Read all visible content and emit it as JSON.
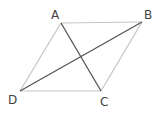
{
  "diagram": {
    "type": "parallelogram with diagonals",
    "vertices": [
      {
        "name": "A",
        "x": 61,
        "y": 23,
        "label_x": 51,
        "label_y": 19
      },
      {
        "name": "B",
        "x": 142,
        "y": 22,
        "label_x": 144,
        "label_y": 19
      },
      {
        "name": "C",
        "x": 101,
        "y": 91,
        "label_x": 101,
        "label_y": 106
      },
      {
        "name": "D",
        "x": 20,
        "y": 91,
        "label_x": 9,
        "label_y": 103
      }
    ],
    "edges": [
      [
        "A",
        "B"
      ],
      [
        "B",
        "C"
      ],
      [
        "C",
        "D"
      ],
      [
        "D",
        "A"
      ]
    ],
    "diagonals": [
      [
        "A",
        "C"
      ],
      [
        "D",
        "B"
      ]
    ],
    "colors": {
      "edge": "#c4c4c4",
      "diagonal": "#555555",
      "label": "#444444"
    }
  },
  "labels": {
    "A": "A",
    "B": "B",
    "C": "C",
    "D": "D"
  }
}
